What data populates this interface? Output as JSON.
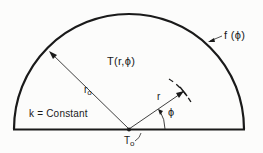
{
  "diagram": {
    "region": {
      "shape": "semicircle",
      "boundary_condition_label": "f (ϕ)",
      "interior_field_label": "T(r,ϕ)",
      "property_label": "k = Constant"
    },
    "labels": {
      "temperature_field": "T(r,ϕ)",
      "boundary_function": "f (ϕ)",
      "outer_radius_main": "r",
      "outer_radius_sub": "o",
      "radial_coord": "r",
      "angle": "ϕ",
      "conductivity": "k = Constant",
      "origin_temp_main": "T",
      "origin_temp_sub": "o"
    },
    "colors": {
      "stroke": "#1a1a1a",
      "background": "#fcfcfb"
    }
  }
}
